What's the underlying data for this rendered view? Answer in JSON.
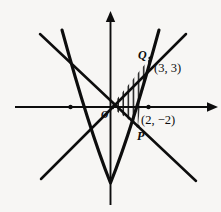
{
  "figure": {
    "type": "math-diagram",
    "background_color": "#f7f6f4",
    "ink_color": "#0d0d0d"
  },
  "axes": {
    "x_axis_name": "x-axis",
    "y_axis_name": "y-axis",
    "origin_label": "O",
    "x_arrow": "right-arrowhead",
    "y_arrow": "up-arrowhead",
    "tick_marks": [
      {
        "name": "x-tick-negative",
        "value": "-2"
      },
      {
        "name": "x-tick-positive",
        "value": "2"
      }
    ]
  },
  "points": [
    {
      "id": "Q",
      "point_label": "Q",
      "coord_label": "(3, 3)",
      "x": 3,
      "y": 3,
      "px": 150,
      "py": 58
    },
    {
      "id": "P",
      "point_label": "P",
      "coord_label": "(2, −2)",
      "x": 2,
      "y": -2,
      "px": 138,
      "py": 126
    }
  ],
  "curves": [
    {
      "name": "parabola",
      "kind": "parabola",
      "note": "opens upward, passes through the origin, vertex below the x-axis"
    },
    {
      "name": "line-rising",
      "kind": "line",
      "note": "line through the origin rising to the upper right, passes through Q"
    },
    {
      "name": "line-falling",
      "kind": "line",
      "note": "line through the origin falling to the lower right, passes through P"
    }
  ],
  "shaded_region": {
    "name": "hatched-region",
    "hatch_style": "vertical-lines",
    "note": "region enclosed by the two lines and the arc of the parabola from P to Q"
  }
}
